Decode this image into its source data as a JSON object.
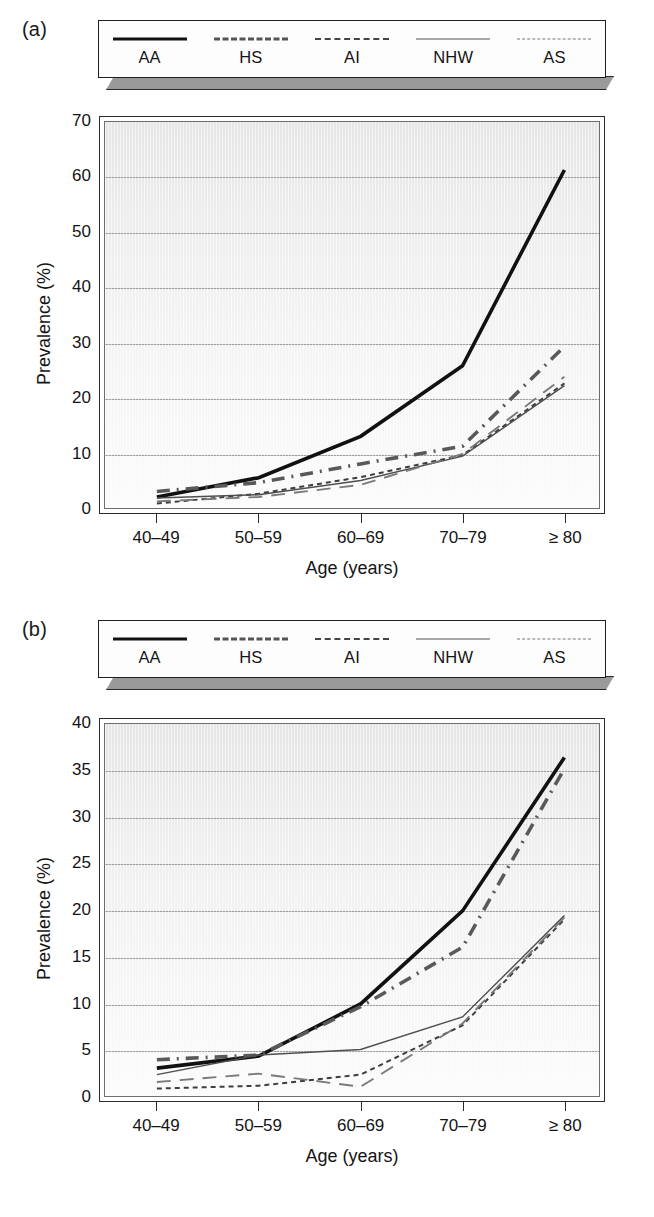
{
  "figure": {
    "panels": [
      {
        "key": "a",
        "label": "(a)",
        "legend": [
          {
            "name": "AA",
            "style": "solid-thick"
          },
          {
            "name": "HS",
            "style": "dash-dot-thick"
          },
          {
            "name": "AI",
            "style": "dotted"
          },
          {
            "name": "NHW",
            "style": "solid-thin"
          },
          {
            "name": "AS",
            "style": "long-dash"
          }
        ]
      },
      {
        "key": "b",
        "label": "(b)",
        "legend": [
          {
            "name": "AA",
            "style": "solid-thick"
          },
          {
            "name": "HS",
            "style": "dash-dot-thick"
          },
          {
            "name": "AI",
            "style": "dotted"
          },
          {
            "name": "NHW",
            "style": "solid-thin"
          },
          {
            "name": "AS",
            "style": "long-dash"
          }
        ]
      }
    ]
  },
  "chart_data": [
    {
      "panel": "a",
      "type": "line",
      "title": "(a)",
      "xlabel": "Age (years)",
      "ylabel": "Prevalence (%)",
      "categories": [
        "40–49",
        "50–59",
        "60–69",
        "70–79",
        "≥ 80"
      ],
      "ylim": [
        0,
        70
      ],
      "yticks": [
        0,
        10,
        20,
        30,
        40,
        50,
        60,
        70
      ],
      "grid": true,
      "legend_position": "top",
      "series": [
        {
          "name": "AA",
          "values": [
            2.0,
            5.5,
            13.0,
            25.8,
            61.3
          ]
        },
        {
          "name": "HS",
          "values": [
            3.0,
            4.6,
            8.0,
            11.2,
            29.3
          ]
        },
        {
          "name": "AI",
          "values": [
            0.8,
            2.6,
            5.6,
            9.6,
            22.6
          ]
        },
        {
          "name": "NHW",
          "values": [
            1.8,
            2.4,
            5.0,
            9.4,
            22.2
          ]
        },
        {
          "name": "AS",
          "values": [
            1.2,
            2.0,
            4.2,
            9.8,
            23.8
          ]
        }
      ]
    },
    {
      "panel": "b",
      "type": "line",
      "title": "(b)",
      "xlabel": "Age (years)",
      "ylabel": "Prevalence (%)",
      "categories": [
        "40–49",
        "50–59",
        "60–69",
        "70–79",
        "≥ 80"
      ],
      "ylim": [
        0,
        40
      ],
      "yticks": [
        0,
        5,
        10,
        15,
        20,
        25,
        30,
        35,
        40
      ],
      "grid": true,
      "legend_position": "top",
      "series": [
        {
          "name": "AA",
          "values": [
            3.0,
            4.3,
            9.9,
            19.9,
            36.4
          ]
        },
        {
          "name": "HS",
          "values": [
            3.9,
            4.4,
            9.6,
            16.0,
            35.2
          ]
        },
        {
          "name": "AI",
          "values": [
            0.8,
            1.1,
            2.3,
            7.6,
            19.0
          ]
        },
        {
          "name": "NHW",
          "values": [
            2.3,
            4.4,
            5.0,
            8.5,
            19.4
          ]
        },
        {
          "name": "AS",
          "values": [
            1.5,
            2.4,
            1.0,
            7.8,
            19.2
          ]
        }
      ]
    }
  ],
  "axis": {
    "x_title": "Age (years)",
    "y_title": "Prevalence (%)"
  },
  "caption": {
    "text": ""
  }
}
